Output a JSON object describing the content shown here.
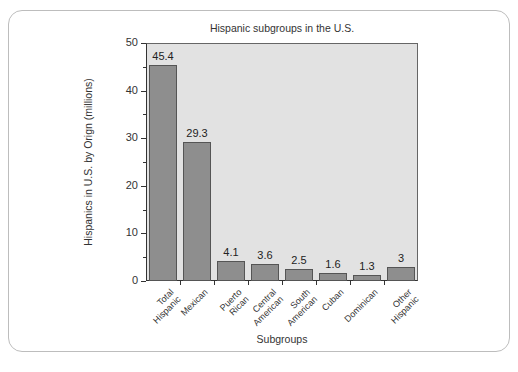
{
  "chart_data": {
    "type": "bar",
    "title": "Hispanic subgroups in the U.S.",
    "xlabel": "Subgroups",
    "ylabel": "Hispanics in U.S. by Orign (millions)",
    "categories": [
      "Total Hispanic",
      "Mexican",
      "Puerto Rican",
      "Central American",
      "South American",
      "Cuban",
      "Dominican",
      "Other Hispanic"
    ],
    "category_lines": [
      [
        "Total",
        "Hispanic"
      ],
      [
        "Mexican"
      ],
      [
        "Puerto",
        "Rican"
      ],
      [
        "Central",
        "American"
      ],
      [
        "South",
        "American"
      ],
      [
        "Cuban"
      ],
      [
        "Dominican"
      ],
      [
        "Other",
        "Hispanic"
      ]
    ],
    "values": [
      45.4,
      29.3,
      4.1,
      3.6,
      2.5,
      1.6,
      1.3,
      3
    ],
    "value_labels": [
      "45.4",
      "29.3",
      "4.1",
      "3.6",
      "2.5",
      "1.6",
      "1.3",
      "3"
    ],
    "ylim": [
      0,
      50
    ],
    "yticks_major": [
      0,
      10,
      20,
      30,
      40,
      50
    ],
    "yticks_minor": [
      5,
      15,
      25,
      35,
      45
    ],
    "grid": false,
    "legend": null,
    "colors": {
      "bar_fill": "#8e8e8e",
      "bar_edge": "#555555",
      "plot_background": "#e2e2e2"
    }
  }
}
